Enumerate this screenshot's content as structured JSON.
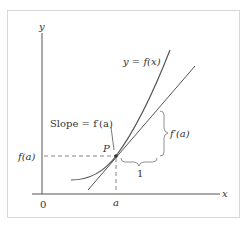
{
  "diagram": {
    "axis_x_label": "x",
    "axis_y_label": "y",
    "origin_label": "0",
    "curve_label": "y = f(x)",
    "slope_label": "Slope = f′(a)",
    "point_label": "P",
    "fa_label": "f(a)",
    "a_label": "a",
    "run_label": "1",
    "rise_label": "f′(a)",
    "colors": {
      "curve": "#555555",
      "axes": "#555555",
      "frame": "#d8d8d8"
    }
  }
}
